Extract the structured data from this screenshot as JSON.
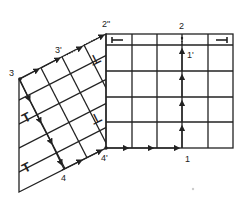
{
  "diagram": {
    "colors": {
      "line": "#222222",
      "background": "#ffffff"
    },
    "labels": {
      "p2": "2",
      "p2pp": "2\"",
      "p3": "3",
      "p3p": "3'",
      "p1": "1",
      "p1p": "1'",
      "p4": "4",
      "p4p": "4'"
    },
    "symbols": {
      "t_symbol": "T",
      "inverted_t_symbol": "⊥"
    },
    "right_grid": {
      "columns": 5,
      "rows": 5,
      "top_strip": true
    },
    "left_grid": {
      "cells_along_edge": 4
    },
    "paths": [
      {
        "name": "path-4p-to-1",
        "style": "solid arrows"
      },
      {
        "name": "path-1-to-2",
        "style": "solid arrows, dotted end"
      },
      {
        "name": "path-3-to-4",
        "style": "solid arrows"
      },
      {
        "name": "path-3-to-2pp",
        "style": "solid then dotted"
      }
    ]
  }
}
